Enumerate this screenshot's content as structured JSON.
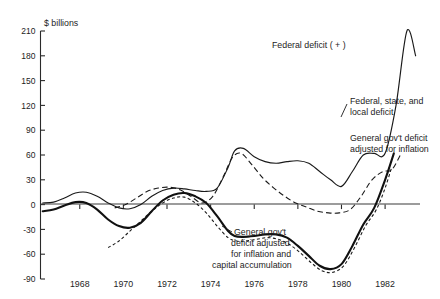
{
  "chart_data": {
    "type": "line",
    "title": "",
    "subtitle": "",
    "unit_label": "$ billions",
    "xlabel": "",
    "ylabel": "$ billions",
    "xlim": [
      1966.2,
      1983.6
    ],
    "ylim": [
      -90,
      210
    ],
    "grid": false,
    "legend_position": "inline-annotations",
    "y_ticks": [
      210,
      180,
      150,
      120,
      90,
      60,
      30,
      0,
      -30,
      -60,
      -90
    ],
    "y_tick_labels": [
      "210",
      "180",
      "150",
      "120",
      "90",
      "60",
      "30",
      "0",
      "-30",
      "-60",
      "-90"
    ],
    "x_ticks": [
      1968,
      1970,
      1972,
      1974,
      1976,
      1978,
      1980,
      1982
    ],
    "x_tick_labels": [
      "1968",
      "1970",
      "1972",
      "1974",
      "1976",
      "1978",
      "1980",
      "1982"
    ],
    "zero_reference_line": 0,
    "series": [
      {
        "name": "Federal deficit ( + )",
        "style": "thin-solid",
        "x": [
          1966.3,
          1966.8,
          1967.3,
          1967.8,
          1968.3,
          1968.8,
          1969.3,
          1969.8,
          1970.3,
          1970.8,
          1971.3,
          1971.8,
          1972.3,
          1972.8,
          1973.3,
          1973.8,
          1974.3,
          1974.8,
          1975.1,
          1975.5,
          1976.0,
          1976.5,
          1977.0,
          1977.5,
          1978.0,
          1978.5,
          1979.0,
          1979.5,
          1980.0,
          1980.5,
          1981.0,
          1981.5,
          1982.0,
          1982.5,
          1983.0,
          1983.4
        ],
        "y": [
          2,
          3,
          8,
          14,
          15,
          10,
          2,
          -4,
          -5,
          0,
          10,
          17,
          20,
          19,
          17,
          16,
          20,
          45,
          65,
          68,
          58,
          52,
          50,
          52,
          53,
          50,
          40,
          30,
          22,
          40,
          60,
          62,
          62,
          120,
          210,
          180
        ]
      },
      {
        "name": "Federal, state, and local deficit",
        "style": "thick-solid",
        "x": [
          1966.3,
          1966.8,
          1967.3,
          1967.8,
          1968.3,
          1968.8,
          1969.3,
          1969.8,
          1970.3,
          1970.8,
          1971.3,
          1971.8,
          1972.3,
          1972.8,
          1973.3,
          1973.8,
          1974.3,
          1974.8,
          1975.1,
          1975.5,
          1976.0,
          1976.5,
          1977.0,
          1977.5,
          1978.0,
          1978.5,
          1979.0,
          1979.5,
          1980.0,
          1980.5,
          1981.0,
          1981.5,
          1982.0,
          1982.4
        ],
        "y": [
          -8,
          -6,
          -1,
          3,
          2,
          -6,
          -18,
          -26,
          -28,
          -22,
          -8,
          5,
          12,
          14,
          10,
          2,
          -14,
          -32,
          -38,
          -39,
          -38,
          -36,
          -36,
          -40,
          -50,
          -62,
          -74,
          -78,
          -72,
          -50,
          -24,
          -4,
          30,
          62
        ]
      },
      {
        "name": "General gov't deficit adjusted for inflation",
        "style": "long-dash",
        "x": [
          1969.6,
          1970.1,
          1970.6,
          1971.1,
          1971.6,
          1972.1,
          1972.6,
          1973.1,
          1973.6,
          1974.1,
          1974.6,
          1975.0,
          1975.4,
          1975.9,
          1976.4,
          1976.9,
          1977.4,
          1977.9,
          1978.4,
          1978.9,
          1979.4,
          1979.9,
          1980.4,
          1980.9,
          1981.4,
          1981.9,
          1982.3,
          1982.7
        ],
        "y": [
          -4,
          0,
          8,
          16,
          20,
          21,
          18,
          10,
          2,
          10,
          35,
          57,
          62,
          48,
          32,
          20,
          10,
          2,
          -3,
          -8,
          -10,
          -10,
          -6,
          10,
          30,
          40,
          42,
          60
        ]
      },
      {
        "name": "General gov't deficit adjusted for inflation and capital accumulation",
        "style": "short-dash",
        "x": [
          1969.3,
          1969.8,
          1970.3,
          1970.8,
          1971.3,
          1971.8,
          1972.3,
          1972.8,
          1973.3,
          1973.8,
          1974.3,
          1974.8,
          1975.2,
          1975.6,
          1976.1,
          1976.6,
          1977.1,
          1977.6,
          1978.1,
          1978.6,
          1979.1,
          1979.6,
          1980.1,
          1980.6,
          1981.1,
          1981.6,
          1982.0,
          1982.3
        ],
        "y": [
          -52,
          -44,
          -32,
          -20,
          -8,
          2,
          8,
          9,
          2,
          -10,
          -26,
          -40,
          -44,
          -44,
          -42,
          -40,
          -42,
          -48,
          -58,
          -70,
          -80,
          -82,
          -74,
          -52,
          -26,
          -6,
          20,
          45
        ]
      }
    ],
    "annotations": [
      {
        "id": "federal-deficit",
        "text": "Federal deficit ( + )",
        "lines": [
          "Federal deficit ( + )"
        ]
      },
      {
        "id": "fsl-deficit",
        "text": "Federal, state, and local deficit",
        "lines": [
          "Federal, state, and",
          "local deficit"
        ]
      },
      {
        "id": "gov-inflation",
        "text": "General gov't deficit adjusted for inflation",
        "lines": [
          "General gov't deficit",
          "adjusted for inflation"
        ]
      },
      {
        "id": "gov-inflation-capital",
        "text": "General gov't deficit adjusted for inflation and capital accumulation",
        "lines": [
          "General gov't",
          "deficit adjusted",
          "for inflation and",
          "capital accumulation"
        ]
      }
    ],
    "colors": {
      "axis": "#2a2a2a",
      "line": "#1a1a1a",
      "background": "#ffffff",
      "text": "#1d1d1d"
    }
  }
}
